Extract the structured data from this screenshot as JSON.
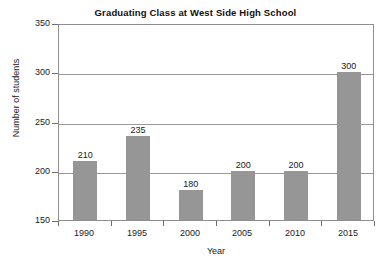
{
  "chart_data": {
    "type": "bar",
    "title": "Graduating Class at West Side High School",
    "xlabel": "Year",
    "ylabel": "Number of students",
    "categories": [
      "1990",
      "1995",
      "2000",
      "2005",
      "2010",
      "2015"
    ],
    "values": [
      210,
      235,
      180,
      200,
      200,
      300
    ],
    "data_labels": [
      "210",
      "235",
      "180",
      "200",
      "200",
      "300"
    ],
    "ylim": [
      150,
      350
    ],
    "ytick_step": 50,
    "ytick_labels": [
      "350",
      "300",
      "250",
      "200",
      "150"
    ],
    "ytick_values": [
      350,
      300,
      250,
      200,
      150
    ],
    "grid": true,
    "grid_axis": "y",
    "legend": "none",
    "bar_color": "#969696",
    "axis_color": "#8e8e8e",
    "gridline_color": "#9a9a9a",
    "background_color": "#ffffff",
    "text_color": "#1a1a1a"
  }
}
